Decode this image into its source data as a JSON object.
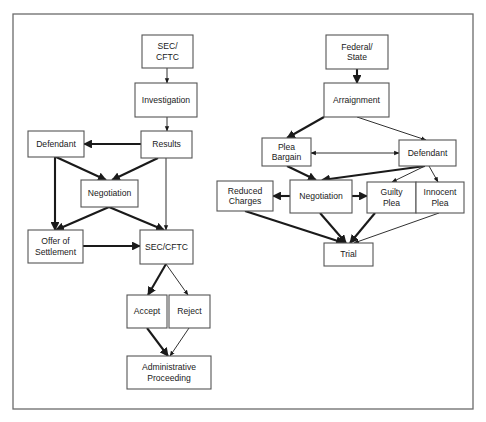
{
  "colors": {
    "frame": "#6b6b6b",
    "box_stroke": "#555555",
    "arrow": "#1a1a1a",
    "text": "#1a1a1a",
    "background": "#ffffff"
  },
  "frame": {
    "x": 13,
    "y": 14,
    "w": 460,
    "h": 395
  },
  "diagrams": [
    {
      "name": "sec-cftc-civil-process",
      "nodes": [
        {
          "id": "sec_cftc_top",
          "lines": [
            "SEC/",
            "CFTC"
          ],
          "x": 142,
          "y": 35,
          "w": 51,
          "h": 33
        },
        {
          "id": "investigation",
          "lines": [
            "Investigation"
          ],
          "x": 135,
          "y": 83,
          "w": 62,
          "h": 34
        },
        {
          "id": "results",
          "lines": [
            "Results"
          ],
          "x": 141,
          "y": 131,
          "w": 51,
          "h": 27
        },
        {
          "id": "defendant_left",
          "lines": [
            "Defendant"
          ],
          "x": 28,
          "y": 131,
          "w": 56,
          "h": 26
        },
        {
          "id": "negotiation_left",
          "lines": [
            "Negotiation"
          ],
          "x": 81,
          "y": 180,
          "w": 57,
          "h": 27
        },
        {
          "id": "offer_settlement",
          "lines": [
            "Offer of",
            "Settlement"
          ],
          "x": 28,
          "y": 230,
          "w": 55,
          "h": 33
        },
        {
          "id": "sec_cftc_mid",
          "lines": [
            "SEC/CFTC"
          ],
          "x": 140,
          "y": 230,
          "w": 53,
          "h": 34
        },
        {
          "id": "accept",
          "lines": [
            "Accept"
          ],
          "x": 127,
          "y": 295,
          "w": 40,
          "h": 33
        },
        {
          "id": "reject",
          "lines": [
            "Reject"
          ],
          "x": 169,
          "y": 295,
          "w": 41,
          "h": 33
        },
        {
          "id": "admin_proceeding",
          "lines": [
            "Administrative",
            "Proceeding"
          ],
          "x": 127,
          "y": 356,
          "w": 84,
          "h": 33
        }
      ],
      "edges": [
        {
          "from": "sec_cftc_top",
          "to": "investigation",
          "weight": "thin",
          "points": [
            [
              167,
              68
            ],
            [
              167,
              83
            ]
          ]
        },
        {
          "from": "investigation",
          "to": "results",
          "weight": "thin",
          "points": [
            [
              167,
              117
            ],
            [
              167,
              131
            ]
          ]
        },
        {
          "from": "results",
          "to": "defendant_left",
          "weight": "thick",
          "points": [
            [
              141,
              144
            ],
            [
              84,
              144
            ]
          ]
        },
        {
          "from": "defendant_left",
          "to": "negotiation_left",
          "weight": "thick",
          "points": [
            [
              56,
              157
            ],
            [
              106,
              180
            ]
          ]
        },
        {
          "from": "results",
          "to": "negotiation_left",
          "weight": "thick",
          "points": [
            [
              158,
              158
            ],
            [
              112,
              180
            ]
          ]
        },
        {
          "from": "defendant_left",
          "to": "offer_settlement",
          "weight": "thick",
          "points": [
            [
              55,
              157
            ],
            [
              55,
              230
            ]
          ]
        },
        {
          "from": "results",
          "to": "sec_cftc_mid",
          "weight": "thin",
          "points": [
            [
              166,
              158
            ],
            [
              166,
              230
            ]
          ]
        },
        {
          "from": "negotiation_left",
          "to": "offer_settlement",
          "weight": "thick",
          "points": [
            [
              109,
              207
            ],
            [
              56,
              230
            ]
          ]
        },
        {
          "from": "negotiation_left",
          "to": "sec_cftc_mid",
          "weight": "thick",
          "points": [
            [
              109,
              207
            ],
            [
              164,
              230
            ]
          ]
        },
        {
          "from": "offer_settlement",
          "to": "sec_cftc_mid",
          "weight": "thick",
          "points": [
            [
              83,
              246
            ],
            [
              140,
              246
            ]
          ]
        },
        {
          "from": "sec_cftc_mid",
          "to": "accept",
          "weight": "thick",
          "points": [
            [
              166,
              264
            ],
            [
              148,
              295
            ]
          ]
        },
        {
          "from": "sec_cftc_mid",
          "to": "reject",
          "weight": "thin",
          "points": [
            [
              166,
              264
            ],
            [
              188,
              295
            ]
          ]
        },
        {
          "from": "accept",
          "to": "admin_proceeding",
          "weight": "thick",
          "points": [
            [
              147,
              328
            ],
            [
              168,
              356
            ]
          ]
        },
        {
          "from": "reject",
          "to": "admin_proceeding",
          "weight": "thin",
          "points": [
            [
              189,
              328
            ],
            [
              170,
              356
            ]
          ]
        }
      ]
    },
    {
      "name": "federal-state-criminal-process",
      "nodes": [
        {
          "id": "federal_state",
          "lines": [
            "Federal/",
            "State"
          ],
          "x": 326,
          "y": 35,
          "w": 62,
          "h": 34
        },
        {
          "id": "arraignment",
          "lines": [
            "Arraignment"
          ],
          "x": 324,
          "y": 83,
          "w": 65,
          "h": 34
        },
        {
          "id": "plea_bargain",
          "lines": [
            "Plea",
            "Bargain"
          ],
          "x": 262,
          "y": 138,
          "w": 49,
          "h": 28
        },
        {
          "id": "defendant_right",
          "lines": [
            "Defendant"
          ],
          "x": 399,
          "y": 140,
          "w": 57,
          "h": 26
        },
        {
          "id": "reduced_charges",
          "lines": [
            "Reduced",
            "Charges"
          ],
          "x": 217,
          "y": 181,
          "w": 56,
          "h": 30
        },
        {
          "id": "negotiation_right",
          "lines": [
            "Negotiation"
          ],
          "x": 290,
          "y": 180,
          "w": 62,
          "h": 33
        },
        {
          "id": "guilty_plea",
          "lines": [
            "Guilty",
            "Plea"
          ],
          "x": 367,
          "y": 182,
          "w": 49,
          "h": 31
        },
        {
          "id": "innocent_plea",
          "lines": [
            "Innocent",
            "Plea"
          ],
          "x": 416,
          "y": 182,
          "w": 48,
          "h": 31
        },
        {
          "id": "trial",
          "lines": [
            "Trial"
          ],
          "x": 324,
          "y": 243,
          "w": 49,
          "h": 23
        }
      ],
      "edges": [
        {
          "from": "federal_state",
          "to": "arraignment",
          "weight": "thick",
          "points": [
            [
              357,
              69
            ],
            [
              357,
              83
            ]
          ]
        },
        {
          "from": "arraignment",
          "to": "plea_bargain",
          "weight": "thick",
          "points": [
            [
              324,
              117
            ],
            [
              287,
              138
            ]
          ]
        },
        {
          "from": "arraignment",
          "to": "defendant_right",
          "weight": "thin",
          "points": [
            [
              357,
              117
            ],
            [
              426,
              140
            ]
          ]
        },
        {
          "from": "plea_bargain",
          "to": "defendant_right",
          "weight": "thin",
          "bidirectional": true,
          "points": [
            [
              311,
              153
            ],
            [
              399,
              153
            ]
          ]
        },
        {
          "from": "plea_bargain",
          "to": "negotiation_right",
          "weight": "thick",
          "points": [
            [
              287,
              166
            ],
            [
              316,
              180
            ]
          ]
        },
        {
          "from": "defendant_right",
          "to": "negotiation_right",
          "weight": "thick",
          "points": [
            [
              425,
              166
            ],
            [
              322,
              180
            ]
          ]
        },
        {
          "from": "defendant_right",
          "to": "guilty_plea",
          "weight": "thin",
          "points": [
            [
              425,
              166
            ],
            [
              392,
              182
            ]
          ]
        },
        {
          "from": "defendant_right",
          "to": "innocent_plea",
          "weight": "thin",
          "points": [
            [
              429,
              166
            ],
            [
              438,
              182
            ]
          ]
        },
        {
          "from": "negotiation_right",
          "to": "reduced_charges",
          "weight": "thick",
          "points": [
            [
              290,
              196
            ],
            [
              273,
              196
            ]
          ]
        },
        {
          "from": "negotiation_right",
          "to": "guilty_plea",
          "weight": "thick",
          "points": [
            [
              352,
              196
            ],
            [
              367,
              196
            ]
          ]
        },
        {
          "from": "reduced_charges",
          "to": "trial",
          "weight": "thick",
          "points": [
            [
              245,
              211
            ],
            [
              344,
              243
            ]
          ]
        },
        {
          "from": "negotiation_right",
          "to": "trial",
          "weight": "thick",
          "points": [
            [
              320,
              213
            ],
            [
              346,
              243
            ]
          ]
        },
        {
          "from": "guilty_plea",
          "to": "trial",
          "weight": "thick",
          "points": [
            [
              375,
              213
            ],
            [
              350,
              243
            ]
          ]
        },
        {
          "from": "innocent_plea",
          "to": "trial",
          "weight": "thin",
          "points": [
            [
              439,
              213
            ],
            [
              354,
              243
            ]
          ]
        }
      ]
    }
  ]
}
